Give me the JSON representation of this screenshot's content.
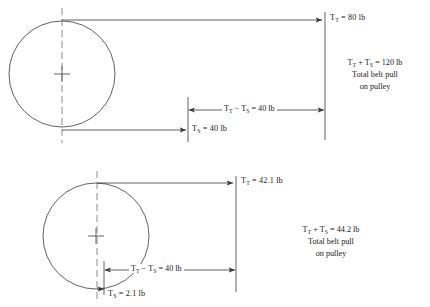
{
  "figure": {
    "stroke_color": "#3a3a3a",
    "text_color": "#1c1c1c",
    "background": "#ffffff"
  },
  "upper": {
    "name": "upper-pulley-diagram",
    "tight_side": {
      "symbol": "T",
      "subscript": "T",
      "operator": "=",
      "value": "80",
      "unit": "lb",
      "text": "T_T = 80 lb"
    },
    "slack_side": {
      "symbol": "T",
      "subscript": "S",
      "operator": "=",
      "value": "40",
      "unit": "lb",
      "text": "T_S = 40 lb"
    },
    "difference": {
      "operator": "−",
      "value": "40",
      "unit": "lb",
      "text": "T_T - T_S = 40 lb"
    },
    "sum_block": {
      "equation_value": "120",
      "equation_unit": "lb",
      "caption_line1": "Total belt pull",
      "caption_line2": "on pulley"
    }
  },
  "lower": {
    "name": "lower-pulley-diagram",
    "tight_side": {
      "symbol": "T",
      "subscript": "T",
      "operator": "=",
      "value": "42.1",
      "unit": "lb",
      "text": "T_T = 42.1 lb"
    },
    "slack_side": {
      "symbol": "T",
      "subscript": "S",
      "operator": "=",
      "value": "2.1",
      "unit": "lb",
      "text": "T_S = 2.1 lb"
    },
    "difference": {
      "operator": "−",
      "value": "40",
      "unit": "lb",
      "text": "T_T - T_S = 40 lb"
    },
    "sum_block": {
      "equation_value": "44.2",
      "equation_unit": "lb",
      "caption_line1": "Total belt pull",
      "caption_line2": "on pulley"
    }
  },
  "symbols": {
    "T": "T",
    "sub_T": "T",
    "sub_S": "S",
    "equals": "=",
    "plus": "+",
    "minus": "−",
    "unit": "lb"
  }
}
